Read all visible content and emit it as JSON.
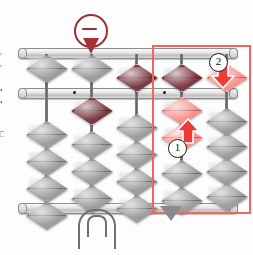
{
  "scene": {
    "kind": "abacus-soroban-illustration",
    "background": "#fdfdfd",
    "width": 253,
    "height": 255
  },
  "colors": {
    "bead_gray": "#9d9d9d",
    "bead_maroon": "#7b3b44",
    "bead_pink": "#f9918c",
    "arrow_red": "#ef3b36",
    "highlight_red": "#f4635c",
    "pin_red": "#9d2f33",
    "frame_gray": "#c4c4c4",
    "rod_gray": "#6f6f6f",
    "pointer_gray": "#8a8a8a"
  },
  "margin_fragments": [
    {
      "text": "▫",
      "top": 50
    },
    {
      "text": "▫",
      "top": 62
    },
    {
      "text": "▪",
      "top": 86
    },
    {
      "text": "▪",
      "top": 98
    },
    {
      "text": "□",
      "top": 130
    }
  ],
  "frame": {
    "top_bar": {
      "label": "top-frame-bar",
      "top": 48
    },
    "middle_bar": {
      "label": "reckoning-bar",
      "top": 88
    },
    "bottom_bar": {
      "label": "bottom-frame-bar",
      "top": 203
    }
  },
  "unit_dots": [
    {
      "x": 73
    },
    {
      "x": 163
    }
  ],
  "columns": [
    {
      "name": "column-1",
      "x": 46,
      "heaven": [
        {
          "color": "gray",
          "position": "up",
          "y": 55
        }
      ],
      "earth": [
        {
          "color": "gray",
          "position": "down",
          "y": 121
        },
        {
          "color": "gray",
          "position": "down",
          "y": 148
        },
        {
          "color": "gray",
          "position": "down",
          "y": 175
        },
        {
          "color": "gray",
          "position": "down",
          "y": 202
        }
      ]
    },
    {
      "name": "column-2",
      "x": 91,
      "heaven": [
        {
          "color": "gray",
          "position": "up",
          "y": 55
        }
      ],
      "earth": [
        {
          "color": "maroon",
          "position": "up",
          "y": 97
        },
        {
          "color": "gray",
          "position": "down",
          "y": 131
        },
        {
          "color": "gray",
          "position": "down",
          "y": 158
        },
        {
          "color": "gray",
          "position": "down",
          "y": 185
        }
      ]
    },
    {
      "name": "column-3",
      "x": 136,
      "heaven": [
        {
          "color": "maroon",
          "position": "down",
          "y": 64
        }
      ],
      "earth": [
        {
          "color": "gray",
          "position": "down",
          "y": 114
        },
        {
          "color": "gray",
          "position": "down",
          "y": 141
        },
        {
          "color": "gray",
          "position": "down",
          "y": 168
        },
        {
          "color": "gray",
          "position": "down",
          "y": 195
        }
      ]
    },
    {
      "name": "column-4",
      "x": 181,
      "heaven": [
        {
          "color": "maroon",
          "position": "down",
          "y": 64
        }
      ],
      "earth": [
        {
          "color": "pink",
          "position": "up",
          "y": 97
        },
        {
          "color": "pink",
          "position": "up",
          "y": 124
        },
        {
          "color": "gray",
          "position": "down",
          "y": 160
        },
        {
          "color": "gray",
          "position": "down",
          "y": 187
        }
      ]
    },
    {
      "name": "column-5",
      "x": 226,
      "heaven": [
        {
          "color": "pink",
          "position": "down",
          "y": 64
        }
      ],
      "earth": [
        {
          "color": "gray",
          "position": "down",
          "y": 108
        },
        {
          "color": "gray",
          "position": "down",
          "y": 133
        },
        {
          "color": "gray",
          "position": "down",
          "y": 158
        },
        {
          "color": "gray",
          "position": "down",
          "y": 183
        }
      ]
    }
  ],
  "highlight_box": {
    "label": "active-columns-highlight",
    "left": 152,
    "top": 45,
    "width": 95,
    "height": 165
  },
  "annotations": [
    {
      "name": "step-marker-1",
      "label": "1",
      "left": 168,
      "top": 139,
      "arrow": {
        "direction": "up",
        "left": 176,
        "top": 118
      }
    },
    {
      "name": "step-marker-2",
      "label": "2",
      "left": 209,
      "top": 53,
      "arrow": {
        "direction": "down",
        "left": 211,
        "top": 63
      }
    }
  ],
  "pin_marker": {
    "name": "minus-operation-pin",
    "symbol": "−",
    "left": 74,
    "top": 14
  },
  "pointer": {
    "name": "column-pointer-triangle",
    "left": 160,
    "top": 206
  },
  "leg": {
    "name": "abacus-leg-handle"
  }
}
